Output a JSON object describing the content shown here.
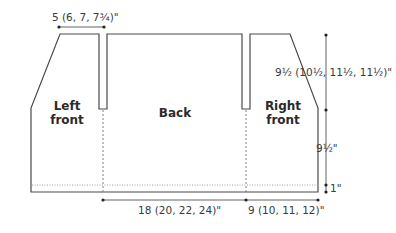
{
  "diagram": {
    "pieces": {
      "left_front": {
        "line1": "Left",
        "line2": "front"
      },
      "back": {
        "label": "Back"
      },
      "right_front": {
        "line1": "Right",
        "line2": "front"
      }
    },
    "dimensions": {
      "shoulder_width": "5 (6, 7, 7¾)\"",
      "armhole_depth": "9½ (10½, 11½, 11½)\"",
      "body_length": "9½\"",
      "hem": "1\"",
      "back_width": "18 (20, 22, 24)\"",
      "front_width": "9 (10, 11, 12)\""
    },
    "colors": {
      "outline": "#4a4a4a",
      "dashed": "#777777",
      "text": "#3a3a3a"
    }
  }
}
